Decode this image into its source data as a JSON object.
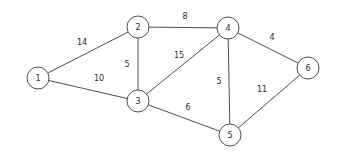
{
  "figure": {
    "kind": "weighted-undirected-graph",
    "background_color": "#fefefe",
    "stroke_color": "#3a3a3a",
    "text_color": "#2b2b2b",
    "node_fill": "#ffffff"
  },
  "chart_data": {
    "type": "diagram",
    "title": "",
    "xlabel": "",
    "ylabel": "",
    "nodes": [
      {
        "id": "n1",
        "label": "1",
        "x": 38,
        "y": 78,
        "r": 11
      },
      {
        "id": "n2",
        "label": "2",
        "x": 138,
        "y": 27,
        "r": 11
      },
      {
        "id": "n3",
        "label": "3",
        "x": 138,
        "y": 101,
        "r": 11
      },
      {
        "id": "n4",
        "label": "4",
        "x": 228,
        "y": 28,
        "r": 11
      },
      {
        "id": "n5",
        "label": "5",
        "x": 230,
        "y": 135,
        "r": 11
      },
      {
        "id": "n6",
        "label": "6",
        "x": 308,
        "y": 68,
        "r": 11
      }
    ],
    "edges": [
      {
        "id": "e12",
        "from": "n1",
        "to": "n2",
        "weight": "14",
        "lx": 82,
        "ly": 42
      },
      {
        "id": "e13",
        "from": "n1",
        "to": "n3",
        "weight": "10",
        "lx": 99,
        "ly": 78
      },
      {
        "id": "e23",
        "from": "n2",
        "to": "n3",
        "weight": "5",
        "lx": 127,
        "ly": 64
      },
      {
        "id": "e24",
        "from": "n2",
        "to": "n4",
        "weight": "8",
        "lx": 185,
        "ly": 16
      },
      {
        "id": "e34",
        "from": "n3",
        "to": "n4",
        "weight": "15",
        "lx": 179,
        "ly": 55
      },
      {
        "id": "e35",
        "from": "n3",
        "to": "n5",
        "weight": "6",
        "lx": 188,
        "ly": 107
      },
      {
        "id": "e45",
        "from": "n4",
        "to": "n5",
        "weight": "5",
        "lx": 219,
        "ly": 81
      },
      {
        "id": "e46",
        "from": "n4",
        "to": "n6",
        "weight": "4",
        "lx": 272,
        "ly": 37
      },
      {
        "id": "e56",
        "from": "n5",
        "to": "n6",
        "weight": "11",
        "lx": 262,
        "ly": 89
      }
    ]
  }
}
